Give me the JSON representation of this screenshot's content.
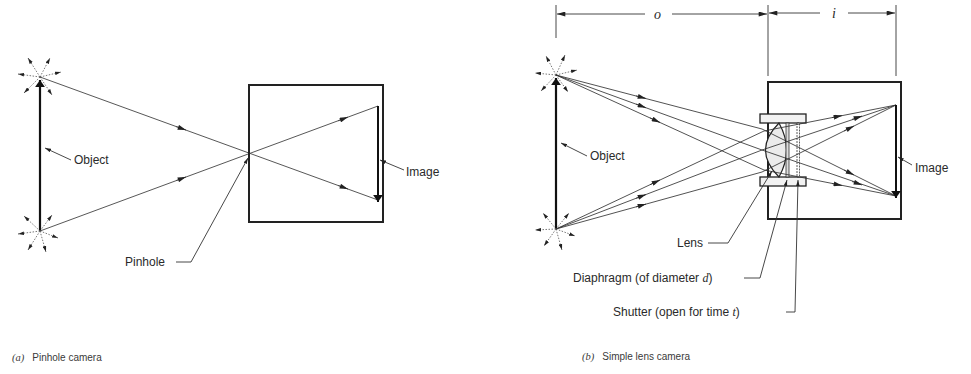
{
  "panel_a": {
    "caption_letter": "(a)",
    "caption_text": "Pinhole camera",
    "labels": {
      "object": "Object",
      "image": "Image",
      "pinhole": "Pinhole"
    }
  },
  "panel_b": {
    "caption_letter": "(b)",
    "caption_text": "Simple lens camera",
    "dimensions": {
      "object_distance": "o",
      "image_distance": "i"
    },
    "labels": {
      "object": "Object",
      "image": "Image",
      "lens": "Lens",
      "diaphragm_prefix": "Diaphragm (of diameter ",
      "diaphragm_var": "d",
      "diaphragm_suffix": ")",
      "shutter_prefix": "Shutter (open for time ",
      "shutter_var": "t",
      "shutter_suffix": ")"
    }
  },
  "colors": {
    "line": "#3a3a3a",
    "heavy": "#1a1a1a",
    "lens_fill": "#ececec"
  }
}
